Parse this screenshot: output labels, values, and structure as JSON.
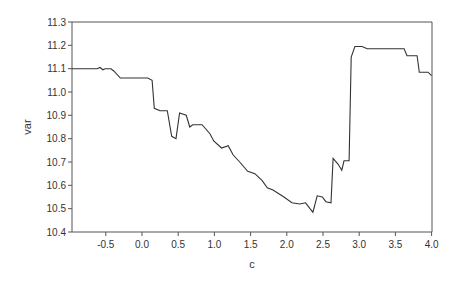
{
  "chart_data": {
    "type": "line",
    "title": "",
    "xlabel": "c",
    "ylabel": "var",
    "xlim": [
      -0.97,
      4.0
    ],
    "ylim": [
      10.4,
      11.3
    ],
    "xticks": [
      "-0.5",
      "0.0",
      "0.5",
      "1.0",
      "1.5",
      "2.0",
      "2.5",
      "3.0",
      "3.5",
      "4.0"
    ],
    "yticks": [
      "10.4",
      "10.5",
      "10.6",
      "10.7",
      "10.8",
      "10.9",
      "11.0",
      "11.1",
      "11.2",
      "11.3"
    ],
    "grid": false,
    "legend": null,
    "series": [
      {
        "name": "var",
        "color": "#333333",
        "x": [
          -0.97,
          -0.62,
          -0.58,
          -0.54,
          -0.51,
          -0.43,
          -0.39,
          -0.3,
          0.08,
          0.14,
          0.17,
          0.25,
          0.35,
          0.41,
          0.47,
          0.52,
          0.61,
          0.66,
          0.7,
          0.83,
          0.94,
          0.99,
          1.1,
          1.19,
          1.26,
          1.35,
          1.46,
          1.56,
          1.66,
          1.73,
          1.81,
          1.96,
          2.07,
          2.18,
          2.26,
          2.32,
          2.36,
          2.42,
          2.49,
          2.54,
          2.61,
          2.64,
          2.71,
          2.76,
          2.79,
          2.86,
          2.89,
          2.94,
          3.04,
          3.11,
          3.62,
          3.66,
          3.8,
          3.83,
          3.95,
          4.0
        ],
        "y": [
          11.1,
          11.1,
          11.105,
          11.095,
          11.1,
          11.1,
          11.09,
          11.06,
          11.06,
          11.05,
          10.93,
          10.92,
          10.92,
          10.81,
          10.8,
          10.91,
          10.9,
          10.85,
          10.86,
          10.86,
          10.82,
          10.79,
          10.76,
          10.77,
          10.73,
          10.7,
          10.66,
          10.65,
          10.62,
          10.59,
          10.58,
          10.55,
          10.525,
          10.52,
          10.525,
          10.5,
          10.485,
          10.555,
          10.55,
          10.53,
          10.525,
          10.715,
          10.69,
          10.665,
          10.705,
          10.705,
          11.15,
          11.195,
          11.195,
          11.185,
          11.185,
          11.155,
          11.155,
          11.085,
          11.085,
          11.07
        ]
      }
    ]
  }
}
